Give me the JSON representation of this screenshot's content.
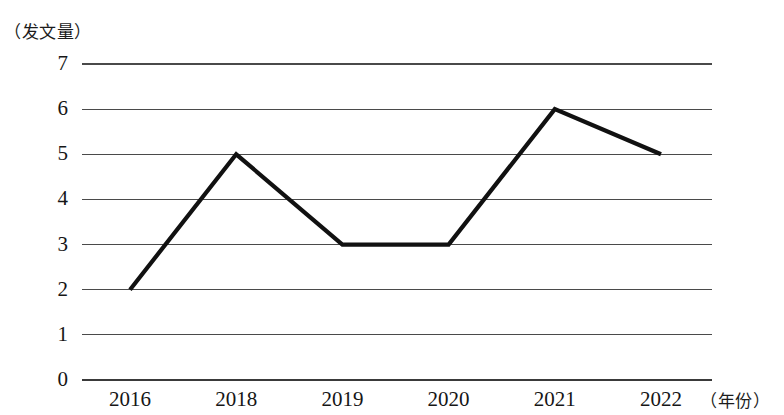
{
  "chart_data": {
    "type": "line",
    "title": "",
    "subtitle": "",
    "xlabel": "（年份）",
    "ylabel": "（发文量）",
    "categories": [
      "2016",
      "2018",
      "2019",
      "2020",
      "2021",
      "2022"
    ],
    "values": [
      2,
      5,
      3,
      3,
      6,
      5
    ],
    "series": [
      {
        "name": "发文量",
        "values": [
          2,
          5,
          3,
          3,
          6,
          5
        ],
        "color": "#111111"
      }
    ],
    "ylim": [
      0,
      7
    ],
    "y_ticks": [
      "0",
      "1",
      "2",
      "3",
      "4",
      "5",
      "6",
      "7"
    ],
    "x_ticks": [
      "2016",
      "2018",
      "2019",
      "2020",
      "2021",
      "2022"
    ],
    "grid": "horizontal",
    "legend": "none",
    "markers": "none",
    "annotations": []
  },
  "axes": {
    "y_caption": "（发文量）",
    "x_caption": "（年份）"
  },
  "colors": {
    "line": "#111111",
    "grid": "#4a4a4a",
    "axis": "#3a3a3a",
    "background": "#ffffff",
    "text": "#161616"
  }
}
